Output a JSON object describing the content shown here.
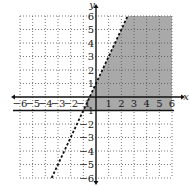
{
  "chart_data": {
    "type": "inequality-graph",
    "title": "",
    "xlabel": "x",
    "ylabel": "y",
    "xlim": [
      -6,
      6
    ],
    "ylim": [
      -6,
      6
    ],
    "grid": true,
    "grid_style": "dotted",
    "x_ticks": [
      "-6",
      "-5",
      "-4",
      "-3",
      "-2",
      "-1",
      "1",
      "2",
      "3",
      "4",
      "5",
      "6"
    ],
    "y_ticks": [
      "6",
      "5",
      "4",
      "3",
      "2",
      "1",
      "-1",
      "-2",
      "-3",
      "-4",
      "-5",
      "-6"
    ],
    "boundaries": [
      {
        "equation": "y = 2x + 1",
        "style": "dashed",
        "points": [
          [
            -3.5,
            -6
          ],
          [
            2.5,
            6
          ]
        ]
      },
      {
        "equation": "y = -1",
        "style": "solid",
        "points": [
          [
            -6,
            -1
          ],
          [
            6,
            -1
          ]
        ]
      }
    ],
    "shaded_region": {
      "description": "y < 2x + 1 and y >= -1",
      "color": "#9a9a9a"
    }
  }
}
